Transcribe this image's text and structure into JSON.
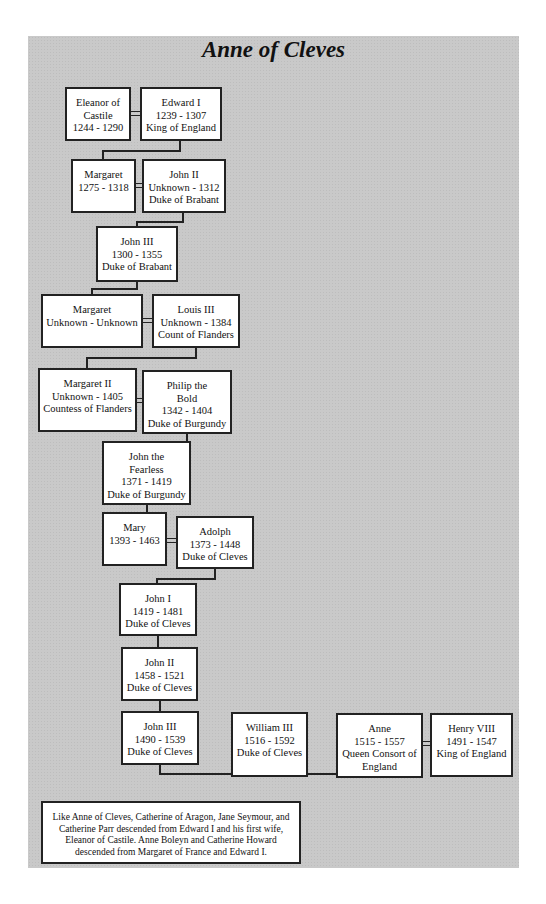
{
  "header_partial_text": "y  g",
  "title": "Anne of Cleves",
  "people": [
    {
      "id": "eleanor",
      "lines": [
        "Eleanor of",
        "Castile",
        "1244 - 1290"
      ]
    },
    {
      "id": "edward1",
      "lines": [
        "Edward I",
        "1239 - 1307",
        "King of England"
      ]
    },
    {
      "id": "margaret1",
      "lines": [
        "Margaret",
        "1275 - 1318"
      ]
    },
    {
      "id": "john2brabant",
      "lines": [
        "John II",
        "Unknown - 1312",
        "Duke of Brabant"
      ]
    },
    {
      "id": "john3brabant",
      "lines": [
        "John III",
        "1300 - 1355",
        "Duke of Brabant"
      ]
    },
    {
      "id": "margaret2",
      "lines": [
        "Margaret",
        "Unknown - Unknown"
      ]
    },
    {
      "id": "louis3",
      "lines": [
        "Louis III",
        "Unknown - 1384",
        "Count of Flanders"
      ]
    },
    {
      "id": "margaretII",
      "lines": [
        "Margaret II",
        "Unknown - 1405",
        "Countess of Flanders"
      ]
    },
    {
      "id": "philip",
      "lines": [
        "Philip the",
        "Bold",
        "1342 - 1404",
        "Duke of Burgundy"
      ]
    },
    {
      "id": "johnfearless",
      "lines": [
        "John the",
        "Fearless",
        "1371 - 1419",
        "Duke of Burgundy"
      ]
    },
    {
      "id": "mary",
      "lines": [
        "Mary",
        "1393 - 1463"
      ]
    },
    {
      "id": "adolph",
      "lines": [
        "Adolph",
        "1373 - 1448",
        "Duke of Cleves"
      ]
    },
    {
      "id": "john1cleves",
      "lines": [
        "John I",
        "1419 - 1481",
        "Duke of Cleves"
      ]
    },
    {
      "id": "john2cleves",
      "lines": [
        "John II",
        "1458 - 1521",
        "Duke of Cleves"
      ]
    },
    {
      "id": "john3cleves",
      "lines": [
        "John III",
        "1490 - 1539",
        "Duke of Cleves"
      ]
    },
    {
      "id": "william3",
      "lines": [
        "William III",
        "1516 - 1592",
        "Duke of Cleves"
      ]
    },
    {
      "id": "anne",
      "lines": [
        "Anne",
        "1515 - 1557",
        "Queen Consort of",
        "England"
      ]
    },
    {
      "id": "henry8",
      "lines": [
        "Henry VIII",
        "1491 - 1547",
        "King of England"
      ]
    }
  ],
  "note": "Like Anne of Cleves, Catherine of Aragon, Jane Seymour, and Catherine Parr descended from Edward I and his first wife, Eleanor of Castile.  Anne Boleyn and Catherine Howard descended from Margaret of France and Edward I."
}
